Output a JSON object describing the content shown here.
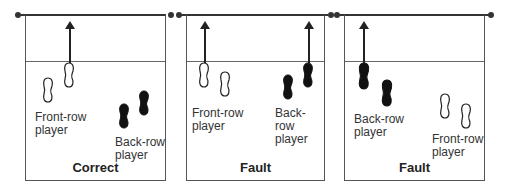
{
  "panels": [
    {
      "verdict": "Correct",
      "front_label_line1": "Front-row",
      "front_label_line2": "player",
      "back_label_line1": "Back-row",
      "back_label_line2": "player",
      "attacker": "front-row"
    },
    {
      "verdict": "Fault",
      "front_label_line1": "Front-row",
      "front_label_line2": "player",
      "back_label_line1": "Back-row",
      "back_label_line2": "player",
      "attacker": "back-row"
    },
    {
      "verdict": "Fault",
      "front_label_line1": "Front-row",
      "front_label_line2": "player",
      "back_label_line1": "Back-row",
      "back_label_line2": "player",
      "attacker": "back-row"
    }
  ],
  "colors": {
    "line": "#333333",
    "front_row_foot": "#ffffff",
    "back_row_foot": "#111111"
  }
}
